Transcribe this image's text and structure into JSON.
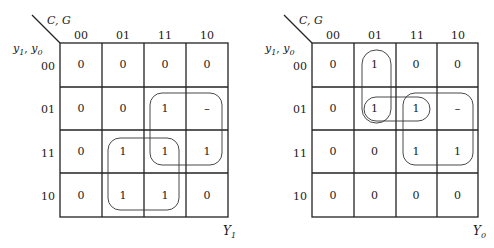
{
  "maps": [
    {
      "id": "Y1",
      "output_name": "Y",
      "output_subscript": "1",
      "col_variables": "C, G",
      "row_var_1": "y",
      "row_var_1_sub": "1",
      "row_var_2": "y",
      "row_var_2_sub": "0",
      "col_headers": [
        "00",
        "01",
        "11",
        "10"
      ],
      "row_headers": [
        "00",
        "01",
        "11",
        "10"
      ],
      "cells": [
        [
          "0",
          "0",
          "0",
          "0"
        ],
        [
          "0",
          "0",
          "1",
          "–"
        ],
        [
          "0",
          "1",
          "1",
          "1"
        ],
        [
          "0",
          "1",
          "1",
          "0"
        ]
      ],
      "groupings": [
        {
          "name": "group-cols-11-10-rows-01-11",
          "x": 150,
          "y": 93,
          "w": 72,
          "h": 72,
          "r": 12
        },
        {
          "name": "group-cols-01-11-rows-11-10",
          "x": 108,
          "y": 138,
          "w": 71,
          "h": 72,
          "r": 12
        }
      ]
    },
    {
      "id": "Y0",
      "output_name": "Y",
      "output_subscript": "0",
      "col_variables": "C, G",
      "row_var_1": "y",
      "row_var_1_sub": "1",
      "row_var_2": "y",
      "row_var_2_sub": "0",
      "col_headers": [
        "00",
        "01",
        "11",
        "10"
      ],
      "row_headers": [
        "00",
        "01",
        "11",
        "10"
      ],
      "cells": [
        [
          "0",
          "1",
          "0",
          "0"
        ],
        [
          "0",
          "1",
          "1",
          "–"
        ],
        [
          "0",
          "0",
          "1",
          "1"
        ],
        [
          "0",
          "0",
          "0",
          "0"
        ]
      ],
      "groupings": [
        {
          "name": "group-col-01-rows-00-01",
          "x": 111,
          "y": 50,
          "w": 29,
          "h": 73,
          "r": 14
        },
        {
          "name": "group-row-01-cols-01-11",
          "x": 113,
          "y": 97,
          "w": 66,
          "h": 24,
          "r": 12
        },
        {
          "name": "group-cols-11-10-rows-01-11",
          "x": 152,
          "y": 93,
          "w": 70,
          "h": 72,
          "r": 12
        }
      ]
    }
  ]
}
